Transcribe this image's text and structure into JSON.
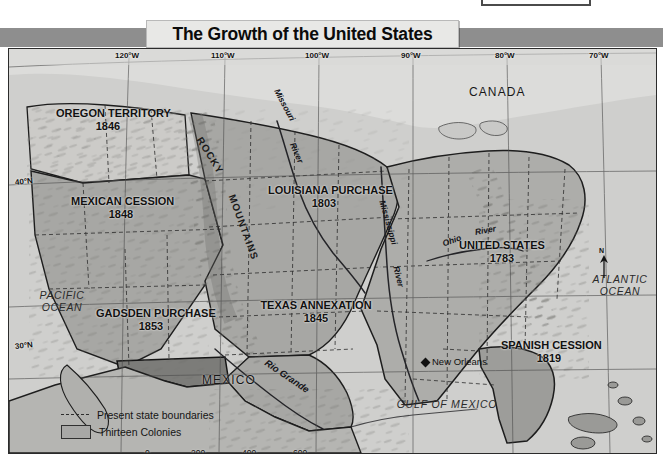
{
  "window": {
    "top_fragment": {
      "name": "partial-dialog-fragment",
      "faint_text": ""
    }
  },
  "title": {
    "text": "The Growth of the United States"
  },
  "map": {
    "type": "historical-territorial-map",
    "subject": "Territorial growth of the United States",
    "territories": [
      {
        "name": "OREGON TERRITORY",
        "year": "1846"
      },
      {
        "name": "MEXICAN CESSION",
        "year": "1848"
      },
      {
        "name": "GADSDEN PURCHASE",
        "year": "1853"
      },
      {
        "name": "LOUISIANA PURCHASE",
        "year": "1803"
      },
      {
        "name": "TEXAS ANNEXATION",
        "year": "1845"
      },
      {
        "name": "UNITED STATES",
        "year": "1783"
      },
      {
        "name": "SPANISH CESSION",
        "year": "1819"
      }
    ],
    "countries": [
      "CANADA",
      "MEXICO"
    ],
    "oceans": [
      "PACIFIC OCEAN",
      "ATLANTIC OCEAN",
      "GULF OF MEXICO"
    ],
    "cities": [
      "New Orleans"
    ],
    "physical_labels": [
      "ROCKY MOUNTAINS",
      "Missouri River",
      "Mississippi River",
      "Ohio River",
      "Rio Grande"
    ],
    "longitude_labels": [
      "120°W",
      "110°W",
      "100°W",
      "90°W",
      "80°W",
      "70°W"
    ],
    "latitude_labels": [
      "40°N",
      "30°N"
    ],
    "north_arrow_label": "N",
    "legend": {
      "items": [
        {
          "symbol": "dashed-line",
          "label": "Present state boundaries"
        },
        {
          "symbol": "shaded-box",
          "label": "Thirteen Colonies"
        }
      ]
    },
    "scale": {
      "miles": {
        "unit_label": "miles",
        "ticks": [
          "0",
          "200",
          "400",
          "600"
        ]
      },
      "kilometers": {
        "unit_label": "kilometers",
        "ticks": [
          "0",
          "200",
          "400",
          "600",
          "800"
        ]
      }
    },
    "colors": {
      "land_light": "#d2d2cf",
      "land_mid": "#a9a9a6",
      "land_dark": "#8d8d8a",
      "ocean": "#cfcfcd",
      "border": "#222222",
      "banner": "#8e8e8e",
      "title_plate": "#e8e8e6"
    }
  }
}
